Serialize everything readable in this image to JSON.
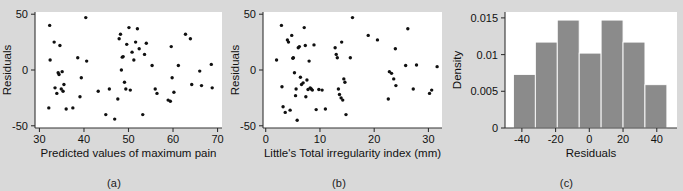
{
  "figure": {
    "background_color": "#d9d9d9",
    "panel_background_color": "#ffffff",
    "point_color": "#101010",
    "bar_color": "#8b8b8b",
    "axis_color": "#333333"
  },
  "panels": [
    {
      "key": "a",
      "caption": "(a)",
      "chart_data": {
        "type": "scatter",
        "title": "",
        "xlabel": "Predicted values of maximum pain",
        "ylabel": "Residuals",
        "xlim": [
          29,
          71
        ],
        "ylim": [
          -52,
          52
        ],
        "xticks": [
          30,
          40,
          50,
          60,
          70
        ],
        "xticklabels": [
          "30",
          "40",
          "50",
          "60",
          "70"
        ],
        "yticks": [
          -50,
          0,
          50
        ],
        "yticklabels": [
          "-50",
          "0",
          "50"
        ],
        "grid": false,
        "legend": "none",
        "x": [
          32.3,
          32.4,
          32.1,
          33.3,
          33.5,
          33.9,
          34.2,
          34.4,
          34.6,
          34.9,
          35.1,
          35.3,
          35.5,
          36.0,
          37.5,
          38.6,
          39.1,
          39.4,
          40.4,
          40.6,
          43.2,
          44.9,
          45.7,
          46.9,
          47.6,
          47.9,
          48.2,
          48.4,
          48.6,
          48.8,
          49.1,
          49.4,
          49.6,
          50.1,
          50.4,
          50.8,
          51.2,
          51.6,
          52.0,
          52.4,
          53.2,
          53.6,
          54.0,
          55.3,
          56.0,
          56.4,
          58.9,
          59.4,
          59.6,
          59.8,
          60.2,
          61.2,
          62.8,
          63.9,
          64.2,
          66.0,
          66.4,
          68.6,
          68.8
        ],
        "y": [
          40.0,
          9.0,
          -34.0,
          25.0,
          -16.0,
          -21.0,
          -2.5,
          -4.0,
          22.0,
          -17.0,
          -1.5,
          -19.0,
          -13.0,
          -35.0,
          -34.0,
          11.0,
          -24.0,
          -7.0,
          47.0,
          8.0,
          -19.0,
          -40.0,
          -17.0,
          -44.0,
          -26.0,
          28.0,
          32.0,
          0.0,
          11.5,
          12.0,
          -11.0,
          -17.0,
          23.0,
          38.0,
          -18.0,
          16.0,
          9.0,
          25.0,
          37.0,
          19.0,
          -40.0,
          14.0,
          24.0,
          4.0,
          -17.0,
          -21.0,
          -27.0,
          -28.0,
          21.0,
          -7.0,
          -20.0,
          4.0,
          32.0,
          28.0,
          -13.0,
          -1.0,
          -14.0,
          5.0,
          -16.0
        ]
      }
    },
    {
      "key": "b",
      "caption": "(b)",
      "chart_data": {
        "type": "scatter",
        "title": "",
        "xlabel": "Little's Total irregularity index (mm)",
        "ylabel": "Residuals",
        "xlim": [
          -0.5,
          32.5
        ],
        "ylim": [
          -52,
          52
        ],
        "xticks": [
          0,
          10,
          20,
          30
        ],
        "xticklabels": [
          "0",
          "10",
          "20",
          "30"
        ],
        "yticks": [
          -50,
          0,
          50
        ],
        "yticklabels": [
          "-50",
          "0",
          "50"
        ],
        "grid": false,
        "legend": "none",
        "x": [
          2.0,
          2.9,
          3.0,
          3.2,
          3.6,
          4.0,
          4.2,
          4.5,
          4.8,
          5.0,
          5.1,
          5.3,
          5.5,
          5.6,
          5.8,
          6.0,
          6.2,
          6.4,
          6.6,
          6.9,
          7.1,
          7.3,
          7.4,
          7.6,
          7.8,
          8.0,
          8.2,
          8.4,
          8.6,
          8.9,
          9.3,
          9.8,
          10.4,
          11.0,
          12.8,
          13.0,
          13.2,
          13.4,
          13.6,
          13.9,
          14.0,
          14.2,
          14.4,
          14.6,
          14.8,
          15.6,
          16.0,
          18.9,
          20.6,
          22.6,
          22.8,
          23.2,
          23.6,
          23.9,
          24.0,
          25.8,
          26.2,
          27.2,
          27.8,
          30.2,
          30.6,
          31.6
        ],
        "y": [
          9.0,
          40.0,
          -15.0,
          -33.0,
          -38.0,
          27.0,
          25.0,
          -36.0,
          31.0,
          10.5,
          11.0,
          -2.5,
          -23.0,
          -17.0,
          -45.0,
          20.0,
          21.0,
          -6.5,
          -13.0,
          -11.5,
          38.0,
          22.0,
          -24.0,
          -9.0,
          -17.5,
          8.0,
          -16.0,
          -17.0,
          -18.0,
          22.5,
          -35.5,
          -17.5,
          -18.0,
          -35.0,
          20.0,
          14.0,
          11.0,
          -17.0,
          -22.0,
          -25.0,
          25.0,
          -27.0,
          -8.0,
          -11.0,
          -40.0,
          11.0,
          47.0,
          31.0,
          27.0,
          -26.0,
          -1.5,
          -3.0,
          -8.0,
          19.0,
          -14.0,
          4.0,
          37.0,
          -17.0,
          4.5,
          -21.0,
          -18.0,
          3.0
        ]
      }
    },
    {
      "key": "c",
      "caption": "(c)",
      "chart_data": {
        "type": "bar",
        "title": "",
        "xlabel": "Residuals",
        "ylabel": "Density",
        "xlim": [
          -50,
          52
        ],
        "ylim": [
          0,
          0.0158
        ],
        "xticks": [
          -40,
          -20,
          0,
          20,
          40
        ],
        "xticklabels": [
          "-40",
          "-20",
          "0",
          "20",
          "40"
        ],
        "yticks": [
          0,
          0.005,
          0.01,
          0.015
        ],
        "yticklabels": [
          "0",
          "0.005",
          "0.01",
          "0.015"
        ],
        "grid": false,
        "legend": "none",
        "bin_edges": [
          -45,
          -32,
          -19,
          -6,
          7,
          20,
          33,
          46
        ],
        "categories": [
          "-45 to -32",
          "-32 to -19",
          "-19 to -6",
          "-6 to 7",
          "7 to 20",
          "20 to 33",
          "33 to 46"
        ],
        "values": [
          0.0073,
          0.0117,
          0.0147,
          0.0102,
          0.0147,
          0.0117,
          0.0059
        ]
      }
    }
  ]
}
